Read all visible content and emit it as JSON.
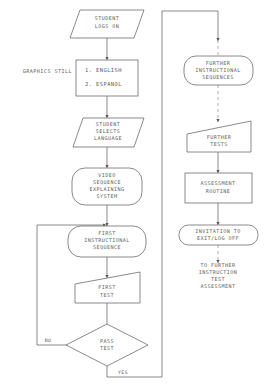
{
  "diagram": {
    "stroke_color": "#6d6d6d",
    "text_color": "#5f5f5f",
    "dashed_color": "#9a9a9a",
    "background": "#ffffff"
  },
  "left_column": {
    "start": {
      "shape": "parallelogram",
      "line1": "STUDENT",
      "line2": "LOGS ON"
    },
    "side_label": "GRAPHICS STILL",
    "menu": {
      "shape": "rectangle",
      "option1": "1.  ENGLISH",
      "option2": "2.  ESPANOL"
    },
    "selects": {
      "shape": "parallelogram",
      "line1": "STUDENT",
      "line2": "SELECTS",
      "line3": "LANGUAGE"
    },
    "video": {
      "shape": "rounded",
      "line1": "VIDEO",
      "line2": "SEQUENCE",
      "line3": "EXPLAINING",
      "line4": "SYSTEM"
    },
    "first_instructional": {
      "shape": "rounded",
      "line1": "FIRST",
      "line2": "INSTRUCTIONAL",
      "line3": "SEQUENCE"
    },
    "first_test": {
      "shape": "trapezoid",
      "line1": "FIRST",
      "line2": "TEST"
    },
    "decision": {
      "shape": "diamond",
      "line1": "PASS",
      "line2": "TEST"
    },
    "label_no": "NO",
    "label_yes": "YES"
  },
  "right_column": {
    "further_sequences": {
      "shape": "rounded",
      "line1": "FURTHER",
      "line2": "INSTRUCTIONAL",
      "line3": "SEQUENCES"
    },
    "further_tests": {
      "shape": "trapezoid",
      "line1": "FURTHER",
      "line2": "TESTS"
    },
    "assessment": {
      "shape": "rectangle",
      "line1": "ASSESSMENT",
      "line2": "ROUTINE"
    },
    "invitation": {
      "shape": "rounded",
      "line1": "INVITATION TO",
      "line2": "EXIT/LOG OFF"
    },
    "tail_note": {
      "line1": "TO FURTHER",
      "line2": "INSTRUCTION",
      "line3": "TEST",
      "line4": "ASSESSMENT"
    }
  }
}
